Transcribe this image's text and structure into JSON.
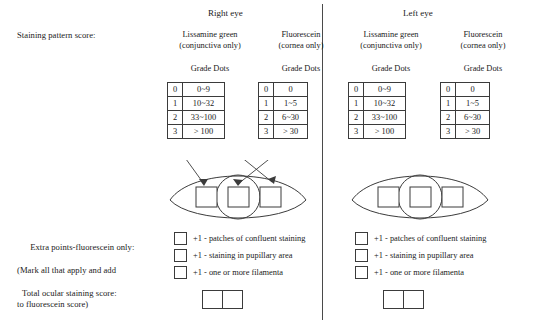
{
  "form": {
    "labels": {
      "staining_pattern_score": "Staining pattern score:",
      "extra_points_line1": "Extra points-fluorescein only:",
      "extra_points_line2": "(Mark all that apply and add",
      "extra_points_line3": "to fluorescein score)",
      "total_ocular_staining_score": "Total ocular staining score:"
    },
    "grade_dots_header": "Grade Dots",
    "stain_types": {
      "lissamine": {
        "line1": "Lissamine green",
        "line2": "(conjunctiva only)"
      },
      "fluorescein": {
        "line1": "Fluorescein",
        "line2": "(cornea only)"
      }
    },
    "grade_tables": {
      "lissamine": {
        "grades": [
          "0",
          "1",
          "2",
          "3"
        ],
        "dots": [
          "0~9",
          "10~32",
          "33~100",
          "> 100"
        ]
      },
      "fluorescein": {
        "grades": [
          "0",
          "1",
          "2",
          "3"
        ],
        "dots": [
          "0",
          "1~5",
          "6~30",
          "> 30"
        ]
      }
    },
    "extra_points": [
      "+1 - patches of confluent staining",
      "+1 - staining in pupillary area",
      "+1 - one or more filamenta"
    ],
    "eyes": [
      {
        "id": "right",
        "title": "Right eye",
        "has_arrows": true
      },
      {
        "id": "left",
        "title": "Left eye",
        "has_arrows": false
      }
    ],
    "eye_diagram": {
      "zones": [
        "nasal-conjunctiva-box",
        "cornea-box",
        "temporal-conjunctiva-box"
      ]
    },
    "colors": {
      "ink": "#1a1a1a",
      "rule": "#3b3b3b",
      "paper": "#ffffff"
    }
  }
}
